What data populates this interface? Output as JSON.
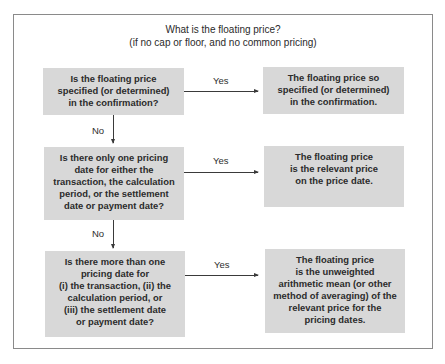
{
  "title": {
    "line1": "What is the floating price?",
    "line2": "(if no cap or floor, and no common pricing)"
  },
  "questions": [
    {
      "text": "Is the floating price\nspecified (or determined)\nin the confirmation?"
    },
    {
      "text": "Is there only one pricing\ndate for either the\ntransaction, the calculation\nperiod, or the settlement\ndate or payment date?"
    },
    {
      "text": "Is there more than one\npricing date for\n(i) the transaction, (ii) the\ncalculation period, or\n(iii) the settlement date\nor payment date?"
    }
  ],
  "answers": [
    {
      "text": "The floating price so\nspecified (or determined)\nin the confirmation."
    },
    {
      "text": "The floating price\nis the relevant price\non the price date."
    },
    {
      "text": "The floating price\nis the unweighted\narithmetic mean (or other\nmethod of averaging) of the\nrelevant price for the\npricing dates."
    }
  ],
  "edges": {
    "yes_label": "Yes",
    "no_label": "No"
  },
  "colors": {
    "box_fill": "#d8d8d8",
    "frame_border": "#8a8a8a",
    "text": "#2e2e2e",
    "arrow": "#3a3a3a"
  }
}
